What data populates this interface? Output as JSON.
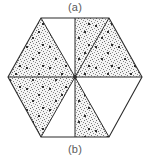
{
  "figure": {
    "type": "hexagon-sector-diagram",
    "caption_top": "(a)",
    "caption_bottom": "(b)",
    "colors": {
      "outline": "#2b2b2b",
      "fill_unshaded": "#ffffff",
      "fill_shaded_base": "#f2f2f2",
      "stipple_dot": "#3a3a3a",
      "label_text": "#5a5a5a",
      "background": "#ffffff"
    },
    "geometry": {
      "center": [
        75,
        77
      ],
      "radius": 67,
      "vertex_count": 6,
      "vertices": [
        {
          "name": "top-left",
          "x": 41,
          "y": 18
        },
        {
          "name": "top-right",
          "x": 109,
          "y": 18
        },
        {
          "name": "right",
          "x": 142,
          "y": 77
        },
        {
          "name": "bottom-right",
          "x": 109,
          "y": 137
        },
        {
          "name": "bottom-left",
          "x": 41,
          "y": 137
        },
        {
          "name": "left",
          "x": 8,
          "y": 77
        }
      ],
      "divider_endpoints": [
        {
          "name": "top-midpoint",
          "x": 75,
          "y": 18
        },
        {
          "name": "bottom-midpoint",
          "x": 75,
          "y": 137
        },
        {
          "name": "upper-left-vertex",
          "x": 41,
          "y": 18
        },
        {
          "name": "upper-right-vertex",
          "x": 109,
          "y": 18
        },
        {
          "name": "lower-left-vertex",
          "x": 41,
          "y": 137
        },
        {
          "name": "lower-right-vertex",
          "x": 109,
          "y": 137
        }
      ]
    },
    "sectors": [
      {
        "id": "sector-top-left",
        "label": "top-left",
        "shaded": false
      },
      {
        "id": "sector-top-right",
        "label": "top-right",
        "shaded": true
      },
      {
        "id": "sector-right",
        "label": "right",
        "shaded": false
      },
      {
        "id": "sector-bottom-right",
        "label": "bottom-right",
        "shaded": true
      },
      {
        "id": "sector-bottom-left",
        "label": "bottom-left",
        "shaded": false
      },
      {
        "id": "sector-left",
        "label": "left",
        "shaded": true
      }
    ]
  }
}
